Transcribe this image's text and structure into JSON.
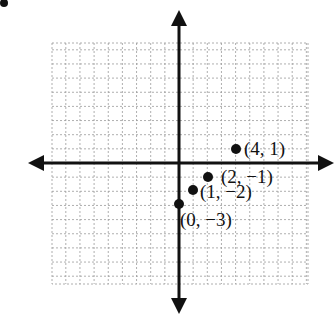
{
  "chart_data": {
    "type": "scatter",
    "title": "",
    "xlabel": "",
    "ylabel": "",
    "grid": true,
    "axes": {
      "origin_px": [
        179,
        163
      ],
      "unit_px": 14.15,
      "x_range_grid": [
        -9,
        9
      ],
      "y_range_grid": [
        -8.5,
        8.5
      ]
    },
    "points": [
      {
        "x": 4,
        "y": 1,
        "label": "(4, 1)"
      },
      {
        "x": 2,
        "y": -1,
        "label": "(2, −1)"
      },
      {
        "x": 1,
        "y": -2,
        "label": "(1, −2)"
      },
      {
        "x": 0,
        "y": -3,
        "label": "(0, −3)"
      }
    ],
    "colors": {
      "axis": "#111111",
      "grid": "#9a9a9a",
      "point": "#111111"
    }
  },
  "corner_mark": "•"
}
